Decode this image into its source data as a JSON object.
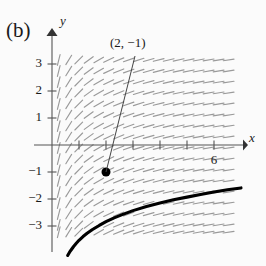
{
  "figure": {
    "panel_label": "(b)",
    "background_color": "#fbfbfb",
    "ink_color": "#1a1a1a",
    "slopefield_color": "#9a9a9a",
    "curve_color": "#000000"
  },
  "axes": {
    "x_label": "x",
    "y_label": "y",
    "origin_px": [
      52,
      145
    ],
    "unit_px": 27,
    "x_range": [
      -0.3,
      7.2
    ],
    "y_range": [
      -4.1,
      3.6
    ],
    "x_tick_labels": [
      {
        "value": 6,
        "text": "6"
      }
    ],
    "y_tick_labels": [
      {
        "value": 3,
        "text": "3"
      },
      {
        "value": 2,
        "text": "2"
      },
      {
        "value": 1,
        "text": "1"
      },
      {
        "value": -1,
        "text": "−1"
      },
      {
        "value": -2,
        "text": "−2"
      },
      {
        "value": -3,
        "text": "−3"
      }
    ],
    "x_arrow": true,
    "y_arrow": true
  },
  "annotation": {
    "point_text": "(2, −1)",
    "point_value": [
      2,
      -1
    ],
    "leader_from_px": [
      135,
      56
    ],
    "leader_to_px": [
      105,
      171
    ]
  },
  "chart_data": {
    "type": "line",
    "title": "",
    "xlabel": "x",
    "ylabel": "y",
    "xlim": [
      -0.3,
      7.2
    ],
    "ylim": [
      -4.1,
      3.6
    ],
    "grid": false,
    "legend": null,
    "slope_field": {
      "description": "direction field of dy/dx = 1/x",
      "slope_formula": "1/x",
      "x_samples": [
        0.25,
        0.62,
        0.99,
        1.36,
        1.73,
        2.1,
        2.47,
        2.84,
        3.21,
        3.58,
        3.95,
        4.32,
        4.69,
        5.06,
        5.43,
        5.8,
        6.17,
        6.54
      ],
      "y_samples": [
        3.15,
        2.74,
        2.33,
        1.93,
        1.52,
        1.11,
        0.7,
        0.3,
        -0.11,
        -0.52,
        -0.93,
        -1.33,
        -1.74,
        -2.15,
        -2.56,
        -2.96,
        -3.23
      ],
      "dash_length_px": 11
    },
    "solution_curve": {
      "equation": "y = ln(x) - 1 - ln(2)",
      "through_point": [
        2,
        -1
      ],
      "points": [
        [
          0.58,
          -4.09
        ],
        [
          0.65,
          -3.97
        ],
        [
          0.72,
          -3.87
        ],
        [
          0.8,
          -3.76
        ],
        [
          0.9,
          -3.64
        ],
        [
          1.0,
          -3.53
        ],
        [
          1.15,
          -3.39
        ],
        [
          1.3,
          -3.27
        ],
        [
          1.5,
          -3.13
        ],
        [
          1.75,
          -2.98
        ],
        [
          2.0,
          -2.84
        ],
        [
          2.3,
          -2.7
        ],
        [
          2.6,
          -2.58
        ],
        [
          3.0,
          -2.43
        ],
        [
          3.5,
          -2.28
        ],
        [
          4.0,
          -2.15
        ],
        [
          4.5,
          -2.03
        ],
        [
          5.0,
          -1.93
        ],
        [
          5.5,
          -1.83
        ],
        [
          6.0,
          -1.74
        ],
        [
          6.5,
          -1.66
        ],
        [
          7.0,
          -1.59
        ]
      ],
      "marked_point": [
        2,
        -1
      ],
      "marked_point_radius_px": 4.5
    }
  }
}
